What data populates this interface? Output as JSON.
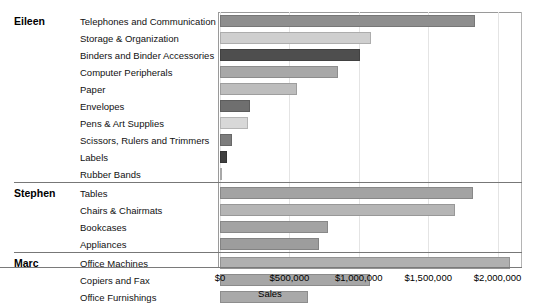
{
  "chart_data": {
    "type": "bar",
    "orientation": "horizontal",
    "title": "",
    "xlabel": "Sales",
    "ylabel": "",
    "xlim": [
      0,
      2170000
    ],
    "xticks": [
      0,
      500000,
      1000000,
      1500000,
      2000000
    ],
    "xtick_labels": [
      "$0",
      "$500,000",
      "$1,000,000",
      "$1,500,000",
      "$2,000,000"
    ],
    "grid": true,
    "legend": "none",
    "groups": [
      {
        "name": "Eileen",
        "items": [
          {
            "category": "Telephones and Communication",
            "value": 1840000,
            "color": "#8e8e8e"
          },
          {
            "category": "Storage & Organization",
            "value": 1085000,
            "color": "#cfcfcf"
          },
          {
            "category": "Binders and Binder Accessories",
            "value": 1012000,
            "color": "#4e4e4e"
          },
          {
            "category": "Computer Peripherals",
            "value": 851000,
            "color": "#a8a8a8"
          },
          {
            "category": "Paper",
            "value": 555000,
            "color": "#bdbdbd"
          },
          {
            "category": "Envelopes",
            "value": 216000,
            "color": "#6f6f6f"
          },
          {
            "category": "Pens & Art Supplies",
            "value": 202000,
            "color": "#d8d8d8"
          },
          {
            "category": "Scissors, Rulers and Trimmers",
            "value": 86000,
            "color": "#7d7d7d"
          },
          {
            "category": "Labels",
            "value": 50000,
            "color": "#3f3f3f"
          },
          {
            "category": "Rubber Bands",
            "value": 11000,
            "color": "#c9c9c9"
          }
        ]
      },
      {
        "name": "Stephen",
        "items": [
          {
            "category": "Tables",
            "value": 1824000,
            "color": "#a3a3a3"
          },
          {
            "category": "Chairs & Chairmats",
            "value": 1694000,
            "color": "#b5b5b5"
          },
          {
            "category": "Bookcases",
            "value": 779000,
            "color": "#a3a3a3"
          },
          {
            "category": "Appliances",
            "value": 714000,
            "color": "#9d9d9d"
          }
        ]
      },
      {
        "name": "Marc",
        "items": [
          {
            "category": "Office Machines",
            "value": 2091000,
            "color": "#b0b0b0"
          },
          {
            "category": "Copiers and Fax",
            "value": 1082000,
            "color": "#a6a6a6"
          },
          {
            "category": "Office Furnishings",
            "value": 634000,
            "color": "#a9a9a9"
          }
        ]
      }
    ]
  }
}
